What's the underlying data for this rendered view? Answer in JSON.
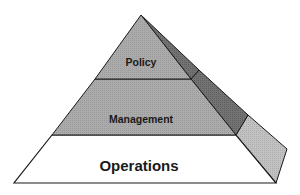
{
  "diagram": {
    "type": "pyramid",
    "tiers": [
      {
        "label": "Policy",
        "front_color": "#a8a8a8",
        "side_color": "#6e6e6e"
      },
      {
        "label": "Management",
        "front_color": "#a3a3a3",
        "side_color": "#6a6a6a"
      },
      {
        "label": "Operations",
        "front_color": "#ffffff",
        "side_color": "#b9b9b9"
      }
    ],
    "stroke_color": "#1a1a1a"
  }
}
